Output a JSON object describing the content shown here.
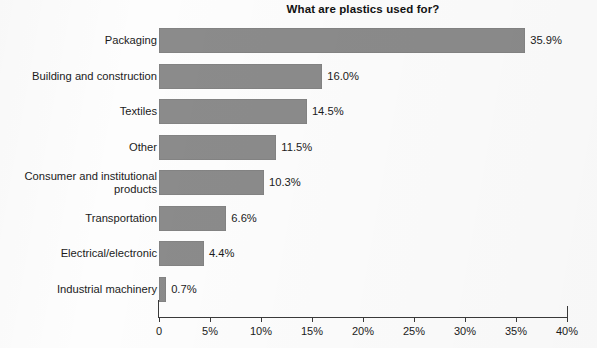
{
  "chart_data": {
    "type": "bar",
    "orientation": "horizontal",
    "title": "What are plastics used for?",
    "xlabel": "",
    "ylabel": "",
    "xlim": [
      0,
      40
    ],
    "grid": false,
    "legend": null,
    "bar_color": "#8b8b8b",
    "background_color": "#fdfdfd",
    "categories": [
      "Packaging",
      "Building and construction",
      "Textiles",
      "Other",
      "Consumer and institutional\nproducts",
      "Transportation",
      "Electrical/electronic",
      "Industrial machinery"
    ],
    "values": [
      35.9,
      16.0,
      14.5,
      11.5,
      10.3,
      6.6,
      4.4,
      0.7
    ],
    "data_labels": [
      "35.9%",
      "16.0%",
      "14.5%",
      "11.5%",
      "10.3%",
      "6.6%",
      "4.4%",
      "0.7%"
    ],
    "xticks": [
      0,
      5,
      10,
      15,
      20,
      25,
      30,
      35,
      40
    ],
    "xtick_labels": [
      "0",
      "5%",
      "10%",
      "15%",
      "20%",
      "25%",
      "30%",
      "35%",
      "40%"
    ]
  }
}
